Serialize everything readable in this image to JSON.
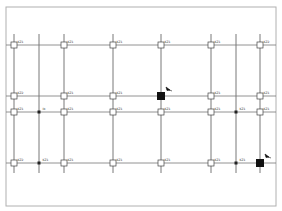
{
  "drawing": {
    "frame": {
      "x": 6,
      "y": 7,
      "width": 270,
      "height": 199,
      "color": "#b0b0b0"
    },
    "grid_color": "#555555",
    "axes_x": [
      14,
      39,
      64,
      113,
      161,
      211,
      236,
      260
    ],
    "axes_y": [
      45,
      96,
      112,
      163
    ],
    "axis_extent": {
      "y_top": 34,
      "y_bottom": 173,
      "x_left": 6,
      "x_right": 276
    },
    "columns": [
      {
        "x": 14,
        "y": 45,
        "type": "hollow",
        "label": "KZ1"
      },
      {
        "x": 64,
        "y": 45,
        "type": "hollow",
        "label": "KZ1"
      },
      {
        "x": 113,
        "y": 45,
        "type": "hollow",
        "label": "KZ1"
      },
      {
        "x": 161,
        "y": 45,
        "type": "hollow",
        "label": "KZ1"
      },
      {
        "x": 211,
        "y": 45,
        "type": "hollow",
        "label": "KZ1"
      },
      {
        "x": 260,
        "y": 45,
        "type": "hollow",
        "label": "KZ2"
      },
      {
        "x": 14,
        "y": 96,
        "type": "hollow",
        "label": "KZ2"
      },
      {
        "x": 64,
        "y": 96,
        "type": "hollow",
        "label": "KZ1"
      },
      {
        "x": 113,
        "y": 96,
        "type": "hollow",
        "label": "KZ1"
      },
      {
        "x": 161,
        "y": 96,
        "type": "solid",
        "label": "Ib"
      },
      {
        "x": 211,
        "y": 96,
        "type": "hollow",
        "label": "KZ1"
      },
      {
        "x": 260,
        "y": 96,
        "type": "hollow",
        "label": "KZ1"
      },
      {
        "x": 14,
        "y": 112,
        "type": "hollow",
        "label": "KZ1"
      },
      {
        "x": 39,
        "y": 112,
        "type": "dot",
        "label": "Ib"
      },
      {
        "x": 64,
        "y": 112,
        "type": "hollow",
        "label": "KZ1"
      },
      {
        "x": 113,
        "y": 112,
        "type": "hollow",
        "label": "KZ1"
      },
      {
        "x": 161,
        "y": 112,
        "type": "hollow",
        "label": "KZ1"
      },
      {
        "x": 211,
        "y": 112,
        "type": "hollow",
        "label": "KZ1"
      },
      {
        "x": 236,
        "y": 112,
        "type": "dot",
        "label": "KZ1"
      },
      {
        "x": 260,
        "y": 112,
        "type": "hollow",
        "label": "KZ1"
      },
      {
        "x": 14,
        "y": 163,
        "type": "hollow",
        "label": "KZ2"
      },
      {
        "x": 39,
        "y": 163,
        "type": "dot",
        "label": "KZ1"
      },
      {
        "x": 64,
        "y": 163,
        "type": "hollow",
        "label": "KZ1"
      },
      {
        "x": 113,
        "y": 163,
        "type": "hollow",
        "label": "KZ1"
      },
      {
        "x": 161,
        "y": 163,
        "type": "hollow",
        "label": "KZ1"
      },
      {
        "x": 211,
        "y": 163,
        "type": "hollow",
        "label": "KZ1"
      },
      {
        "x": 236,
        "y": 163,
        "type": "dot",
        "label": "KZ1"
      },
      {
        "x": 260,
        "y": 163,
        "type": "solid",
        "label": "Ib"
      }
    ]
  }
}
